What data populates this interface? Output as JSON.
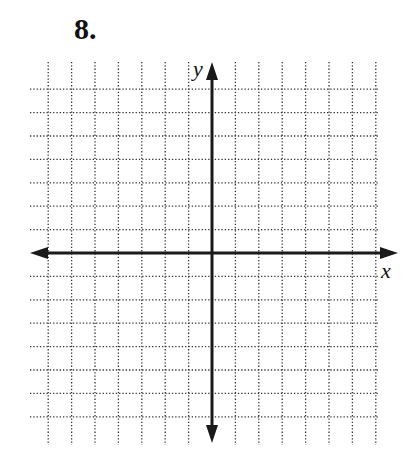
{
  "problem": {
    "number": "8."
  },
  "axes": {
    "x_label": "x",
    "y_label": "y",
    "origin_px": [
      212,
      253
    ],
    "x_arrow_left_tip": 30,
    "x_arrow_right_tip": 398,
    "y_arrow_top_tip": 62,
    "y_arrow_bottom_tip": 443,
    "color": "#1a1a1a"
  },
  "grid": {
    "style": "dotted",
    "color": "#333333",
    "spacing_px": 23.4,
    "columns_left_of_y_axis": 7,
    "columns_right_of_y_axis": 7,
    "rows_above_x_axis": 7,
    "rows_below_x_axis": 7,
    "horizontal_line_extent_x": [
      30,
      378
    ],
    "vertical_line_extent_y": [
      62,
      445
    ]
  }
}
